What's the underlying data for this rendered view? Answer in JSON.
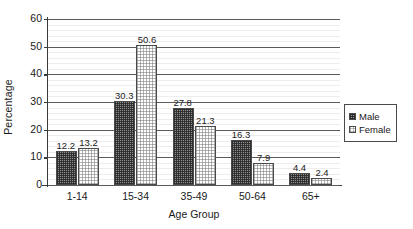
{
  "chart_data": {
    "type": "bar",
    "title": "",
    "xlabel": "Age Group",
    "ylabel": "Percentage",
    "categories": [
      "1-14",
      "15-34",
      "35-49",
      "50-64",
      "65+"
    ],
    "series": [
      {
        "name": "Male",
        "values": [
          12.2,
          30.3,
          27.8,
          16.3,
          4.4
        ]
      },
      {
        "name": "Female",
        "values": [
          13.2,
          50.6,
          21.3,
          7.9,
          2.4
        ]
      }
    ],
    "ylim": [
      0,
      60
    ],
    "yticks": [
      0,
      10,
      20,
      30,
      40,
      50,
      60
    ],
    "ytick_labels": [
      "0",
      "10",
      "20",
      "30",
      "40",
      "50",
      "60"
    ],
    "minor_ticks_per_major": 4,
    "grid": true,
    "grid_axis": "y",
    "legend_position": "right",
    "data_labels": true,
    "colors": {
      "male_fill": "#8d8d8d",
      "female_fill": "#ffffff",
      "bar_border": "#4a4a4a",
      "axis": "#3a3a3a",
      "major_gridline": "#5a5a5a",
      "minor_gridline": "#ededed",
      "background": "#ffffff",
      "text": "#1a1a1a"
    }
  },
  "legend": {
    "items": [
      {
        "label": "Male",
        "swatch": "male-swatch-icon"
      },
      {
        "label": "Female",
        "swatch": "female-swatch-icon"
      }
    ]
  }
}
